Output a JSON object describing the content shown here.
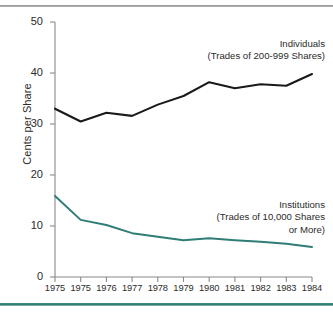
{
  "chart_data": {
    "type": "line",
    "title": "",
    "xlabel": "",
    "ylabel": "Cents per Share",
    "ylim": [
      0,
      50
    ],
    "yticks": [
      0,
      10,
      20,
      30,
      40,
      50
    ],
    "grid": false,
    "legend_position": "inline-annotations",
    "categories": [
      "1975",
      "1975",
      "1976",
      "1977",
      "1978",
      "1979",
      "1980",
      "1981",
      "1982",
      "1983",
      "1984"
    ],
    "series": [
      {
        "name": "Individuals",
        "annotation": [
          "Individuals",
          "(Trades of 200-999 Shares)"
        ],
        "color": "#1a1a1a",
        "values": [
          33.0,
          30.5,
          32.2,
          31.6,
          33.8,
          35.5,
          38.2,
          37.0,
          37.8,
          37.5,
          39.8
        ]
      },
      {
        "name": "Institutions",
        "annotation": [
          "Institutions",
          "(Trades of 10,000 Shares",
          "or More)"
        ],
        "color": "#2f7d76",
        "values": [
          15.9,
          11.2,
          10.2,
          8.6,
          7.9,
          7.2,
          7.6,
          7.2,
          6.9,
          6.5,
          5.9
        ]
      }
    ]
  },
  "axes": {
    "y_label": "Cents per Share",
    "y_tick_labels": [
      "50",
      "40",
      "30",
      "20",
      "10",
      "0"
    ],
    "x_tick_labels": [
      "1975",
      "1975",
      "1976",
      "1977",
      "1978",
      "1979",
      "1980",
      "1981",
      "1982",
      "1983",
      "1984"
    ]
  },
  "annotations": {
    "individuals": {
      "line1": "Individuals",
      "line2": "(Trades of 200-999 Shares)"
    },
    "institutions": {
      "line1": "Institutions",
      "line2": "(Trades of 10,000 Shares",
      "line3": "or More)"
    }
  },
  "colors": {
    "individuals_line": "#1a1a1a",
    "institutions_line": "#2f7d76",
    "axis": "#8a8a8a",
    "top_rule": "#8e8e8e",
    "bottom_rule": "#2f7d76",
    "background": "#ffffff"
  }
}
